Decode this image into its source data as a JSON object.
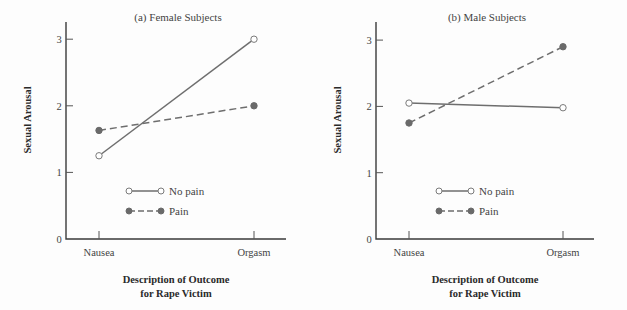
{
  "chart_data": [
    {
      "type": "line",
      "title": "(a) Female Subjects",
      "xlabel": "Description of Outcome for Rape Victim",
      "xlabel_lines": [
        "Description of Outcome",
        "for Rape Victim"
      ],
      "ylabel": "Sexual Arousal",
      "categories": [
        "Nausea",
        "Orgasm"
      ],
      "yticks": [
        0,
        1,
        2,
        3
      ],
      "ylim": [
        0,
        3.25
      ],
      "grid": false,
      "legend_position": "lower-center inside",
      "series": [
        {
          "name": "No pain",
          "style": "solid",
          "marker": "open-circle",
          "values": [
            1.25,
            3.0
          ]
        },
        {
          "name": "Pain",
          "style": "dashed",
          "marker": "filled-circle",
          "values": [
            1.63,
            2.0
          ]
        }
      ]
    },
    {
      "type": "line",
      "title": "(b) Male Subjects",
      "xlabel": "Description of Outcome for Rape Victim",
      "xlabel_lines": [
        "Description of Outcome",
        "for Rape Victim"
      ],
      "ylabel": "Sexual Arousal",
      "categories": [
        "Nausea",
        "Orgasm"
      ],
      "yticks": [
        0,
        1,
        2,
        3
      ],
      "ylim": [
        0,
        3.25
      ],
      "grid": false,
      "legend_position": "lower-center inside",
      "series": [
        {
          "name": "No pain",
          "style": "solid",
          "marker": "open-circle",
          "values": [
            2.05,
            1.98
          ]
        },
        {
          "name": "Pain",
          "style": "dashed",
          "marker": "filled-circle",
          "values": [
            1.75,
            2.9
          ]
        }
      ]
    }
  ],
  "colors": {
    "line": "#6e6e6e",
    "axis": "#3a3a3a",
    "text": "#444444",
    "background": "#fdfdfd"
  }
}
